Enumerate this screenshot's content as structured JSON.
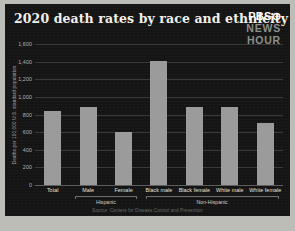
{
  "card": {
    "title": "2020 death rates by race and ethnicity",
    "source": "Source: Centers for Disease Control and Prevention",
    "logo": {
      "line1": "PBS⊙",
      "line2": "NEWS",
      "line3": "HOUR"
    },
    "colors": {
      "background": "#141414",
      "bar": "#9b9b9b",
      "grid": "#3a3a3a",
      "title_text": "#f2f0ec",
      "frame": "#bdbdb8"
    }
  },
  "chart_data": {
    "type": "bar",
    "title": "2020 death rates by race and ethnicity",
    "xlabel": "",
    "ylabel": "Deaths per 100,000 U.S. standard population",
    "ylim": [
      0,
      1600
    ],
    "yticks": [
      1600,
      1400,
      1200,
      1000,
      800,
      600,
      400,
      200,
      0
    ],
    "ytick_labels": [
      "1,600",
      "1,400",
      "1,200",
      "1,000",
      "800",
      "600",
      "400",
      "200",
      "0"
    ],
    "grid": true,
    "legend": "none",
    "categories": [
      "Total",
      "Male",
      "Female",
      "Black male",
      "Black female",
      "White male",
      "White female"
    ],
    "values": [
      835,
      880,
      600,
      1410,
      880,
      890,
      700
    ],
    "groups": [
      {
        "label": "Hispanic",
        "categories": [
          "Male",
          "Female"
        ],
        "start_index": 1,
        "end_index": 2
      },
      {
        "label": "Non-Hispanic",
        "categories": [
          "Black male",
          "Black female",
          "White male",
          "White female"
        ],
        "start_index": 3,
        "end_index": 6
      }
    ],
    "series": [
      {
        "name": "Deaths per 100,000 U.S. standard population",
        "values": [
          835,
          880,
          600,
          1410,
          880,
          890,
          700
        ]
      }
    ]
  }
}
